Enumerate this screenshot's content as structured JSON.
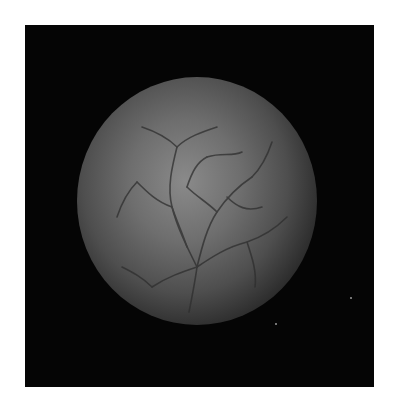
{
  "image": {
    "description": "Grayscale fundus photograph showing retina with branching blood vessels inside a black square frame",
    "colors": {
      "background": "#ffffff",
      "frame": "#050505",
      "fundus_center": "#8a8a8a",
      "vessel": "#2e2e2e"
    }
  }
}
